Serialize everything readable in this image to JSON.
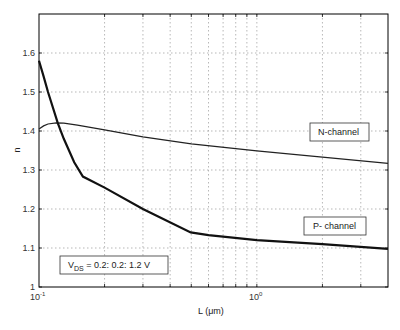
{
  "chart_data": {
    "type": "line",
    "title": "",
    "xlabel": "L (μm)",
    "ylabel": "n",
    "xscale": "log",
    "xlim": [
      0.1,
      4.0
    ],
    "ylim": [
      1.0,
      1.7
    ],
    "grid": true,
    "x_tick_labels": [
      "10^-1",
      "10^0"
    ],
    "y_ticks": [
      1,
      1.1,
      1.2,
      1.3,
      1.4,
      1.5,
      1.6
    ],
    "y_tick_labels": [
      "1",
      "1.1",
      "1.2",
      "1.3",
      "1.4",
      "1.5",
      "1.6"
    ],
    "series": [
      {
        "name": "N-channel",
        "x": [
          0.1,
          0.105,
          0.11,
          0.12,
          0.13,
          0.15,
          0.2,
          0.3,
          0.5,
          1.0,
          2.0,
          4.0
        ],
        "y": [
          1.405,
          1.413,
          1.418,
          1.421,
          1.42,
          1.415,
          1.403,
          1.385,
          1.367,
          1.349,
          1.333,
          1.317
        ]
      },
      {
        "name": "P- channel",
        "x": [
          0.1,
          0.105,
          0.11,
          0.122,
          0.13,
          0.145,
          0.159,
          0.2,
          0.3,
          0.497,
          0.6,
          1.0,
          2.0,
          4.0
        ],
        "y": [
          1.58,
          1.54,
          1.5,
          1.42,
          1.38,
          1.32,
          1.283,
          1.255,
          1.2,
          1.14,
          1.133,
          1.12,
          1.11,
          1.098
        ]
      }
    ],
    "annotations": [
      {
        "text": "N-channel",
        "x": 2.2,
        "y": 1.39
      },
      {
        "text": "P- channel",
        "x": 2.2,
        "y": 1.17
      },
      {
        "text": "V_DS = 0.2: 0.2: 1.2 V",
        "x": 0.14,
        "y": 1.05
      }
    ]
  },
  "labels": {
    "xlabel_prefix": "L  (",
    "xlabel_unit": "μm",
    "xlabel_suffix": ")",
    "ylabel": "n",
    "xtick_0_base": "10",
    "xtick_0_exp": "-1",
    "xtick_1_base": "10",
    "xtick_1_exp": "0",
    "n_channel": "N-channel",
    "p_channel": "P- channel",
    "vds_main": "V",
    "vds_sub": "DS",
    "vds_rest": " = 0.2: 0.2: 1.2 V"
  }
}
